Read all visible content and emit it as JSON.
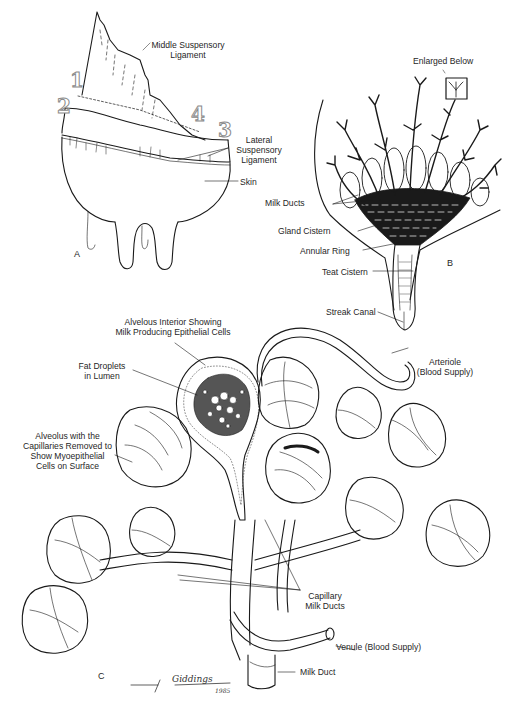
{
  "figure": {
    "panels": {
      "a": {
        "letter": "A",
        "labels": {
          "middle_suspensory_1": "Middle Suspensory",
          "middle_suspensory_2": "Ligament",
          "lateral_suspensory_1": "Lateral",
          "lateral_suspensory_2": "Suspensory",
          "lateral_suspensory_3": "Ligament",
          "skin": "Skin"
        },
        "markers": [
          "1",
          "2",
          "3",
          "4"
        ]
      },
      "b": {
        "letter": "B",
        "labels": {
          "enlarged_below": "Enlarged Below",
          "milk_ducts": "Milk Ducts",
          "gland_cistern": "Gland Cistern",
          "annular_ring": "Annular Ring",
          "teat_cistern": "Teat Cistern",
          "streak_canal": "Streak Canal"
        }
      },
      "c": {
        "letter": "C",
        "labels": {
          "alveolus_interior_1": "Alvelous Interior Showing",
          "alveolus_interior_2": "Milk Producing Epithelial Cells",
          "fat_droplets_1": "Fat Droplets",
          "fat_droplets_2": "in Lumen",
          "alveolus_removed_1": "Alveolus with the",
          "alveolus_removed_2": "Capillaries Removed to",
          "alveolus_removed_3": "Show Myoepithelial",
          "alveolus_removed_4": "Cells on Surface",
          "arteriole_1": "Arteriole",
          "arteriole_2": "(Blood Supply)",
          "capillary_1": "Capillary",
          "capillary_2": "Milk Ducts",
          "venule": "Venule (Blood Supply)",
          "milk_duct": "Milk Duct"
        }
      }
    },
    "signature": {
      "name": "Giddings",
      "year": "1985"
    },
    "colors": {
      "ink": "#1a1a1a",
      "background": "#ffffff",
      "marker_outline": "#8a8a8a"
    }
  }
}
